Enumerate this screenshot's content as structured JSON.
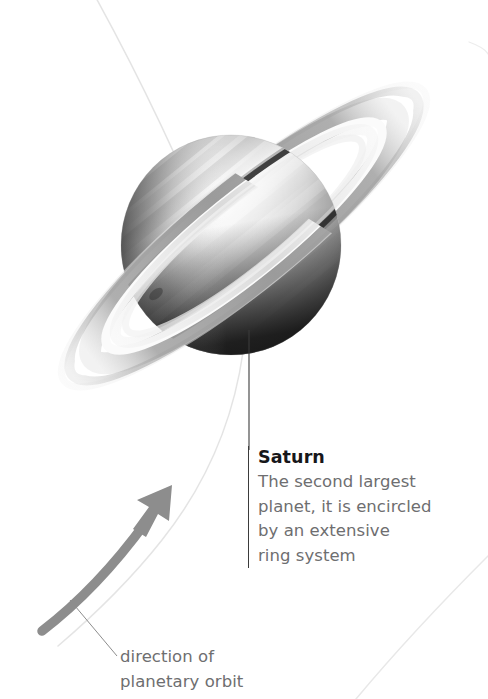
{
  "figure": {
    "subject": "Saturn",
    "background_color": "#ffffff",
    "canvas": {
      "width": 488,
      "height": 699
    }
  },
  "callouts": {
    "saturn": {
      "title": "Saturn",
      "description": "The second largest planet, it is encircled by an extensive ring system",
      "lines": [
        "The second largest",
        "planet, it is encircled",
        "by an extensive",
        "ring system"
      ],
      "title_color": "#17171a",
      "body_color": "#6e6e70",
      "rule_color": "#3b3b3b"
    },
    "orbit": {
      "description": "direction of planetary orbit",
      "lines": [
        "direction of",
        "planetary orbit"
      ],
      "body_color": "#6e6e70"
    }
  },
  "graphics": {
    "planet": {
      "name": "saturn-planet-sphere",
      "center_x": 231,
      "center_y": 245,
      "radius": 110,
      "highlight_color": "#f2f2f2",
      "midtone_color": "#9a9a9a",
      "shadow_color": "#1c1c1c",
      "band_count": 9
    },
    "rings": {
      "name": "saturn-ring-system",
      "center_x": 244,
      "center_y": 236,
      "semi_major": 231,
      "semi_minor": 52,
      "tilt_degrees": -39,
      "bands": [
        {
          "label": "outer-faint-ring",
          "color": "#e3e3e3"
        },
        {
          "label": "a-ring",
          "color": "#b8b8b8"
        },
        {
          "label": "cassini-division",
          "color": "#ffffff"
        },
        {
          "label": "b-ring",
          "color": "#a0a0a0"
        },
        {
          "label": "inner-gap",
          "color": "#ffffff"
        },
        {
          "label": "c-ring",
          "color": "#d6d6d6"
        }
      ]
    },
    "orbit_path": {
      "name": "planetary-orbit-curve",
      "color": "#e2e2e2",
      "stroke_width": 1.4
    },
    "orbit_arrow": {
      "name": "orbit-direction-arrow",
      "color": "#8d8d8d",
      "tip_x": 172,
      "tip_y": 485,
      "tail_x": 42,
      "tail_y": 631
    },
    "leader_lines": {
      "saturn_leader": {
        "x": 249,
        "y_top": 330,
        "y_bottom": 446,
        "color": "#3b3b3b"
      },
      "orbit_leader": {
        "x1": 70,
        "y1": 601,
        "x2": 116,
        "y2": 655,
        "color": "#6e6e70"
      }
    }
  }
}
